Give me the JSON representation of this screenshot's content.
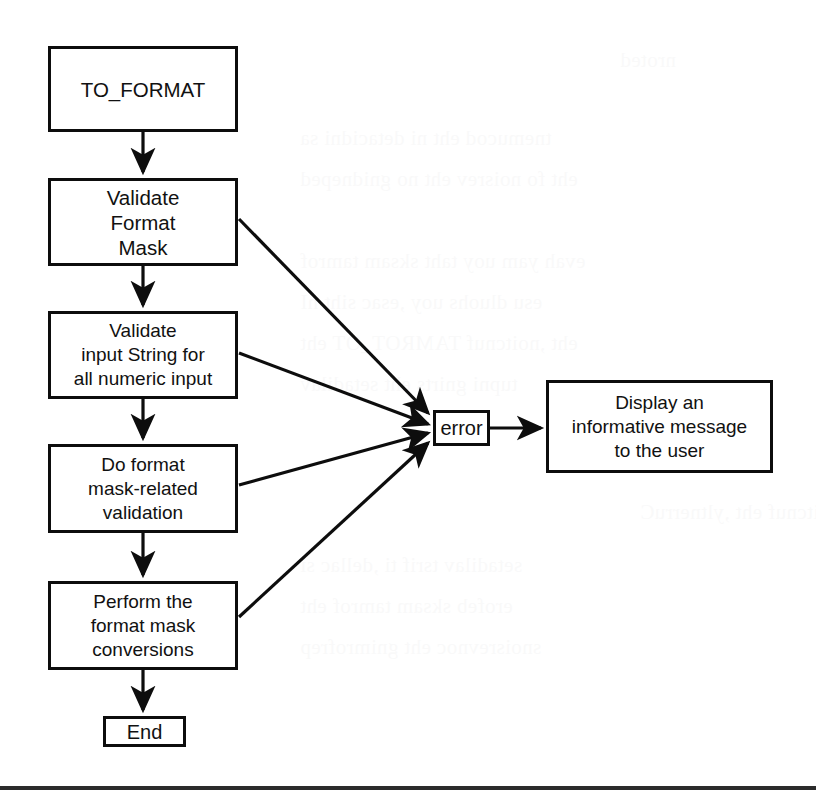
{
  "diagram": {
    "type": "flowchart",
    "nodes": [
      {
        "id": "start",
        "label": "TO_FORMAT"
      },
      {
        "id": "validate-mask",
        "label": "Validate\nFormat\nMask"
      },
      {
        "id": "validate-input",
        "label": "Validate\ninput String for\nall numeric input"
      },
      {
        "id": "do-format",
        "label": "Do format\nmask-related\nvalidation"
      },
      {
        "id": "perform",
        "label": "Perform the\nformat mask\nconversions"
      },
      {
        "id": "end",
        "label": "End"
      },
      {
        "id": "error",
        "label": "error"
      },
      {
        "id": "display",
        "label": "Display an\ninformative message\nto the user"
      }
    ],
    "edges": [
      {
        "from": "start",
        "to": "validate-mask",
        "label": ""
      },
      {
        "from": "validate-mask",
        "to": "validate-input",
        "label": ""
      },
      {
        "from": "validate-input",
        "to": "do-format",
        "label": ""
      },
      {
        "from": "do-format",
        "to": "perform",
        "label": ""
      },
      {
        "from": "perform",
        "to": "end",
        "label": ""
      },
      {
        "from": "validate-mask",
        "to": "error",
        "label": ""
      },
      {
        "from": "validate-input",
        "to": "error",
        "label": ""
      },
      {
        "from": "do-format",
        "to": "error",
        "label": ""
      },
      {
        "from": "perform",
        "to": "error",
        "label": ""
      },
      {
        "from": "error",
        "to": "display",
        "label": ""
      }
    ],
    "colors": {
      "stroke": "#0d0d0d",
      "fill": "#ffffff",
      "text": "#111111",
      "rule": "#2b2b2b"
    }
  },
  "background": {
    "ghost_lines": [
      "nroted",
      "tnemucod eht ni detacidni sa",
      "eht fo noisrev eht no gnidneped",
      "evah yam uoy taht sksam tamrof",
      "esu dluohs uoy ,esac siht nI",
      "eht ,noitcnuf TAMROT_OT eht",
      "tupni gnirts eht setadilav",
      "noitcnuf eht ,yltnerruC",
      "setadilav tsrif ti ,dellac si",
      "erofeb sksam tamrof eht",
      "snoisrevnoc eht gnimrofrep"
    ]
  }
}
